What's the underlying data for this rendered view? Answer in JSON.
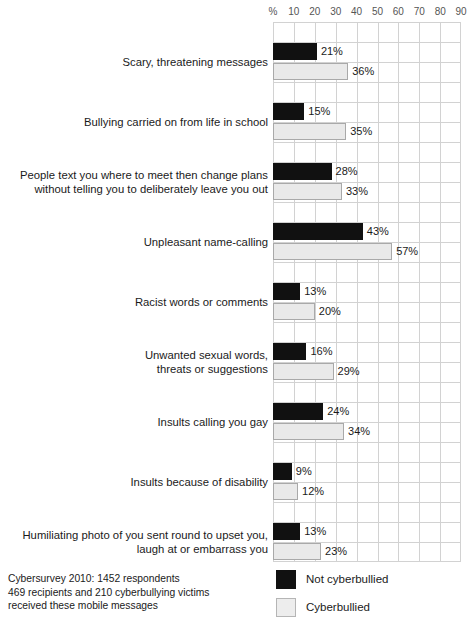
{
  "chart_data": {
    "type": "bar",
    "orientation": "horizontal",
    "title": "",
    "xlabel": "",
    "ylabel": "",
    "xlim": [
      0,
      90
    ],
    "grid": true,
    "legend_position": "bottom-right",
    "axis_ticks": [
      "%",
      "10",
      "20",
      "30",
      "40",
      "50",
      "60",
      "70",
      "80",
      "90"
    ],
    "categories": [
      "Scary, threatening messages",
      "Bullying carried on from life in school",
      "People text you where to meet then change plans without telling you to deliberately leave you out",
      "Unpleasant name-calling",
      "Racist words or comments",
      "Unwanted sexual words, threats or suggestions",
      "Insults calling you gay",
      "Insults because of disability",
      "Humiliating photo of you sent round to upset you, laugh at or embarrass you"
    ],
    "category_lines": [
      [
        "Scary, threatening messages"
      ],
      [
        "Bullying carried on from life in school"
      ],
      [
        "People text you where to meet then change plans",
        "without telling you to deliberately leave you out"
      ],
      [
        "Unpleasant name-calling"
      ],
      [
        "Racist words or comments"
      ],
      [
        "Unwanted sexual words,",
        "threats or suggestions"
      ],
      [
        "Insults calling you gay"
      ],
      [
        "Insults because of disability"
      ],
      [
        "Humiliating photo of you sent round to upset you,",
        "laugh at or embarrass you"
      ]
    ],
    "series": [
      {
        "name": "Not cyberbullied",
        "color": "#111111",
        "values": [
          21,
          15,
          28,
          43,
          13,
          16,
          24,
          9,
          13
        ],
        "labels": [
          "21%",
          "15%",
          "28%",
          "43%",
          "13%",
          "16%",
          "24%",
          "9%",
          "13%"
        ]
      },
      {
        "name": "Cyberbullied",
        "color": "#e9e9e9",
        "values": [
          36,
          35,
          33,
          57,
          20,
          29,
          34,
          12,
          23
        ],
        "labels": [
          "36%",
          "35%",
          "33%",
          "57%",
          "20%",
          "29%",
          "34%",
          "12%",
          "23%"
        ]
      }
    ]
  },
  "legend": {
    "items": [
      {
        "label": "Not cyberbullied",
        "swatch": "dark"
      },
      {
        "label": "Cyberbullied",
        "swatch": "light"
      }
    ]
  },
  "footnote": {
    "lines": [
      "Cybersurvey 2010: 1452 respondents",
      "469 recipients and 210 cyberbullying victims",
      "received these mobile messages"
    ]
  },
  "colors": {
    "not_cyberbullied": "#111111",
    "cyberbullied": "#e9e9e9",
    "grid": "#d2d2d2",
    "text": "#1a1a1a",
    "tick_text": "#555555"
  }
}
